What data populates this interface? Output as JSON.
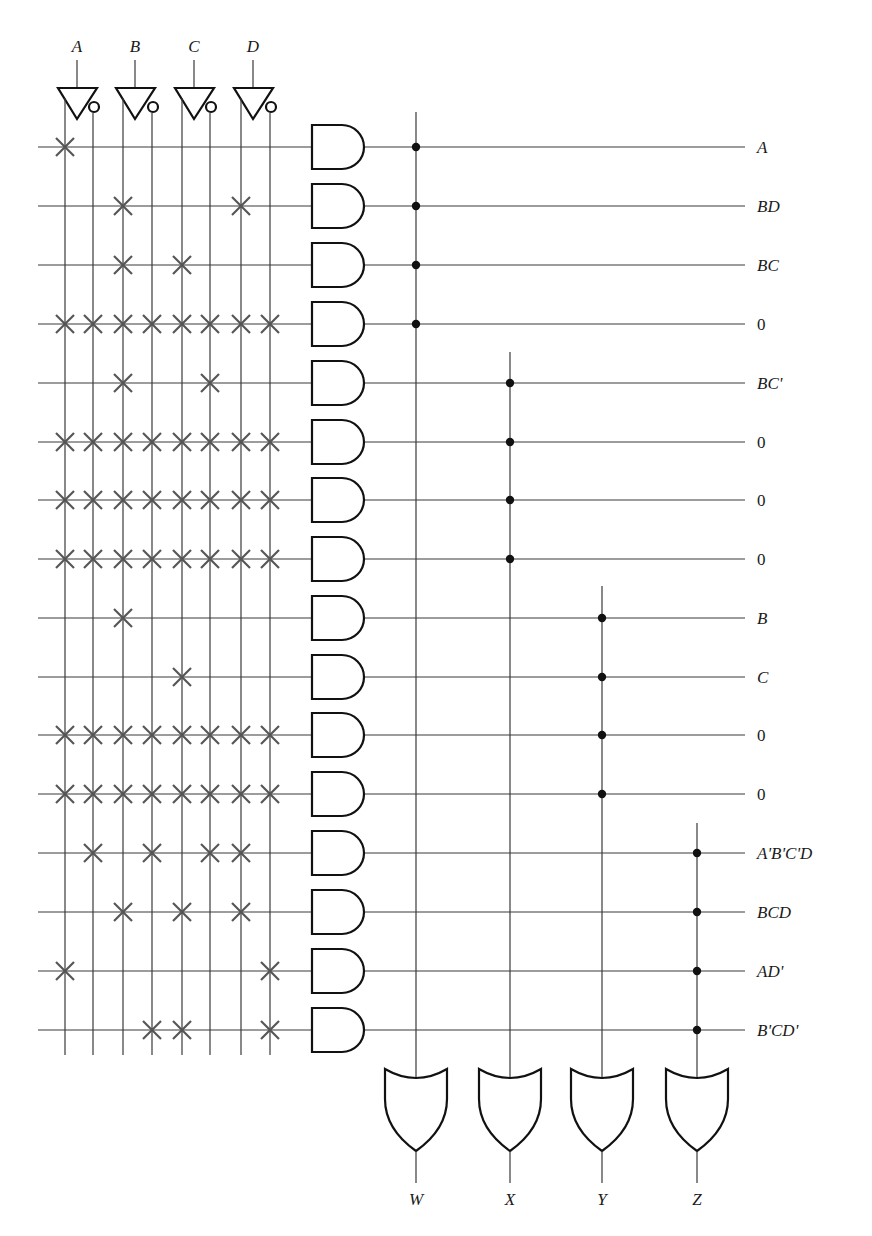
{
  "inputs": [
    {
      "name": "A",
      "x_true": 65,
      "x_comp": 93,
      "cx": 77
    },
    {
      "name": "B",
      "x_true": 123,
      "x_comp": 152,
      "cx": 135
    },
    {
      "name": "C",
      "x_true": 182,
      "x_comp": 210,
      "cx": 194
    },
    {
      "name": "D",
      "x_true": 241,
      "x_comp": 270,
      "cx": 253
    }
  ],
  "input_columns": [
    "A",
    "A'",
    "B",
    "B'",
    "C",
    "C'",
    "D",
    "D'"
  ],
  "column_x": [
    65,
    93,
    123,
    152,
    182,
    210,
    241,
    270
  ],
  "product_terms": [
    {
      "label": "A",
      "y": 147,
      "fuses": [
        0
      ],
      "output": "W"
    },
    {
      "label": "BD",
      "y": 206,
      "fuses": [
        2,
        6
      ],
      "output": "W"
    },
    {
      "label": "BC",
      "y": 265,
      "fuses": [
        2,
        4
      ],
      "output": "W"
    },
    {
      "label": "0",
      "y": 324,
      "fuses": [
        0,
        1,
        2,
        3,
        4,
        5,
        6,
        7
      ],
      "output": "W"
    },
    {
      "label": "BC'",
      "y": 383,
      "fuses": [
        2,
        5
      ],
      "output": "X"
    },
    {
      "label": "0",
      "y": 442,
      "fuses": [
        0,
        1,
        2,
        3,
        4,
        5,
        6,
        7
      ],
      "output": "X"
    },
    {
      "label": "0",
      "y": 500,
      "fuses": [
        0,
        1,
        2,
        3,
        4,
        5,
        6,
        7
      ],
      "output": "X"
    },
    {
      "label": "0",
      "y": 559,
      "fuses": [
        0,
        1,
        2,
        3,
        4,
        5,
        6,
        7
      ],
      "output": "X"
    },
    {
      "label": "B",
      "y": 618,
      "fuses": [
        2
      ],
      "output": "Y"
    },
    {
      "label": "C",
      "y": 677,
      "fuses": [
        4
      ],
      "output": "Y"
    },
    {
      "label": "0",
      "y": 735,
      "fuses": [
        0,
        1,
        2,
        3,
        4,
        5,
        6,
        7
      ],
      "output": "Y"
    },
    {
      "label": "0",
      "y": 794,
      "fuses": [
        0,
        1,
        2,
        3,
        4,
        5,
        6,
        7
      ],
      "output": "Y"
    },
    {
      "label": "A'B'C'D",
      "y": 853,
      "fuses": [
        1,
        3,
        5,
        6
      ],
      "output": "Z"
    },
    {
      "label": "BCD",
      "y": 912,
      "fuses": [
        2,
        4,
        6
      ],
      "output": "Z"
    },
    {
      "label": "AD'",
      "y": 971,
      "fuses": [
        0,
        7
      ],
      "output": "Z"
    },
    {
      "label": "B'CD'",
      "y": 1030,
      "fuses": [
        3,
        4,
        7
      ],
      "output": "Z"
    }
  ],
  "outputs": [
    {
      "name": "W",
      "x": 416,
      "top": 112,
      "first_row": 0,
      "last_row": 3
    },
    {
      "name": "X",
      "x": 510,
      "top": 352,
      "first_row": 4,
      "last_row": 7
    },
    {
      "name": "Y",
      "x": 602,
      "top": 586,
      "first_row": 8,
      "last_row": 11
    },
    {
      "name": "Z",
      "x": 697,
      "top": 823,
      "first_row": 12,
      "last_row": 15
    }
  ],
  "geometry": {
    "row_line_start": 38,
    "row_line_end": 745,
    "label_x": 757,
    "and_left": 312,
    "and_half_height": 22,
    "and_body": 30,
    "col_bottom": 1055,
    "or_top": 1069,
    "or_tip": 1151,
    "or_half_width": 31,
    "out_end": 1183,
    "out_label_y": 1205
  }
}
